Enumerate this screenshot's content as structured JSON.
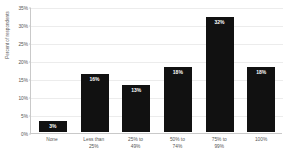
{
  "chart_data": {
    "type": "bar",
    "title": "",
    "xlabel": "",
    "ylabel": "Percent of respondents",
    "ylim": [
      0,
      35
    ],
    "grid": true,
    "legend": false,
    "categories": [
      "None",
      "Less than 25%",
      "25% to 49%",
      "50% to 74%",
      "75% to 99%",
      "100%"
    ],
    "category_lines": [
      [
        "None",
        ""
      ],
      [
        "Less than",
        "25%"
      ],
      [
        "25% to",
        "49%"
      ],
      [
        "50% to",
        "74%"
      ],
      [
        "75% to",
        "99%"
      ],
      [
        "100%",
        ""
      ]
    ],
    "values": [
      3,
      16,
      13,
      18,
      32,
      18
    ],
    "data_labels": [
      "3%",
      "16%",
      "13%",
      "18%",
      "32%",
      "18%"
    ],
    "yticks": [
      0,
      5,
      10,
      15,
      20,
      25,
      30,
      35
    ],
    "ytick_labels": [
      "0%",
      "5%",
      "10%",
      "15%",
      "20%",
      "25%",
      "30%",
      "35%"
    ],
    "bar_color": "#111111",
    "data_label_color": "#ffffff",
    "gridline_color": "#ececec",
    "axis_color": "#c9c9c9",
    "background_color": "#ffffff"
  }
}
